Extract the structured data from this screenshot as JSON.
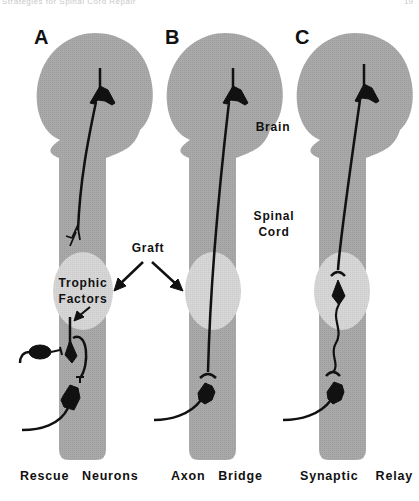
{
  "header": {
    "running_title": "Strategies for Spinal Cord Repair",
    "page_number": "19"
  },
  "panels": [
    {
      "letter": "A",
      "caption": "Rescue   Neurons",
      "graft_label": "Trophic\nFactors"
    },
    {
      "letter": "B",
      "caption": "Axon   Bridge"
    },
    {
      "letter": "C",
      "caption": "Synaptic    Relay"
    }
  ],
  "labels": {
    "brain": "Brain",
    "spinal_cord": "Spinal\nCord",
    "graft": "Graft",
    "trophic_line1": "Trophic",
    "trophic_line2": "Factors",
    "spinal_line1": "Spinal",
    "spinal_line2": "Cord"
  },
  "colors": {
    "cns_gray": "#a6a6a6",
    "graft_gray": "#d4d4d4",
    "neuron_black": "#111111",
    "background": "#ffffff"
  }
}
